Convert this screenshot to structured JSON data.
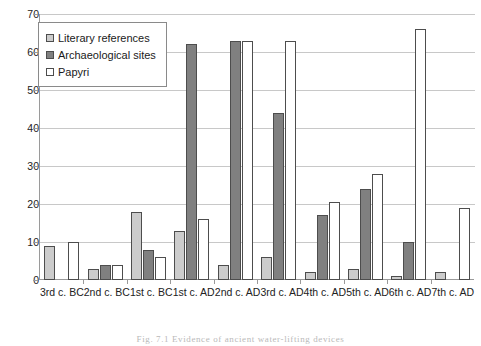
{
  "chart_data": {
    "type": "bar",
    "title": "",
    "subtitle": "",
    "xlabel": "",
    "ylabel": "",
    "ylim": [
      0,
      70
    ],
    "ytick_step": 10,
    "yticks": [
      70,
      60,
      50,
      40,
      30,
      20,
      10,
      0
    ],
    "grid": "horizontal",
    "legend_position": "top-left",
    "categories": [
      "3rd c. BC",
      "2nd c. BC",
      "1st c. BC",
      "1st c. AD",
      "2nd c. AD",
      "3rd c. AD",
      "4th c. AD",
      "5th c. AD",
      "6th c. AD",
      "7th c. AD"
    ],
    "series": [
      {
        "name": "Literary references",
        "color": "#cccccc",
        "values": [
          9,
          3,
          18,
          13,
          4,
          6,
          2,
          3,
          1,
          2
        ]
      },
      {
        "name": "Archaeological sites",
        "color": "#808080",
        "values": [
          0,
          4,
          8,
          62,
          63,
          44,
          17,
          24,
          10,
          0
        ]
      },
      {
        "name": "Papyri",
        "color": "#ffffff",
        "values": [
          10,
          4,
          6,
          16,
          63,
          63,
          20.5,
          28,
          66,
          19
        ]
      }
    ]
  },
  "legend": {
    "items": [
      {
        "label": "Literary references"
      },
      {
        "label": "Archaeological sites"
      },
      {
        "label": "Papyri"
      }
    ]
  },
  "caption": {
    "text": "Fig. 7.1  Evidence of ancient water-lifting devices"
  }
}
